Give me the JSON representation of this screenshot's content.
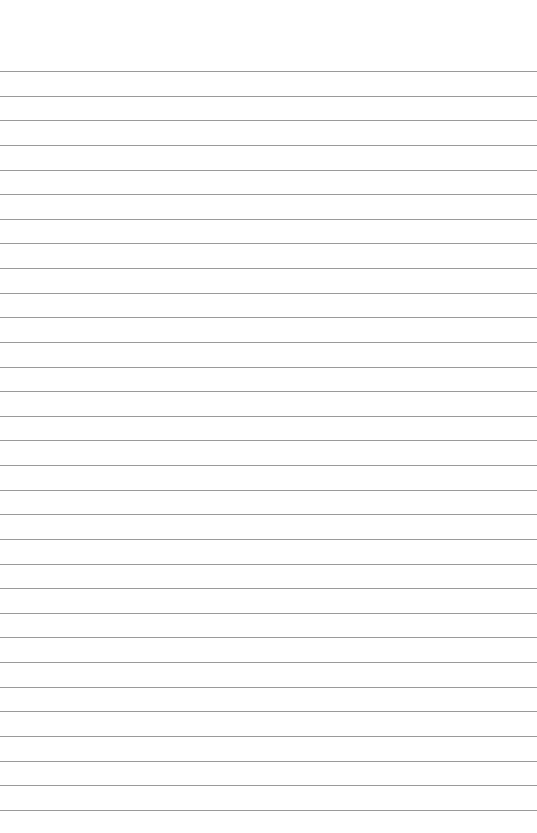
{
  "page": {
    "type": "lined-paper",
    "background_color": "#ffffff",
    "line_color": "#9a9a9a",
    "first_line_y": 71,
    "line_spacing": 24.63,
    "line_count": 31
  }
}
